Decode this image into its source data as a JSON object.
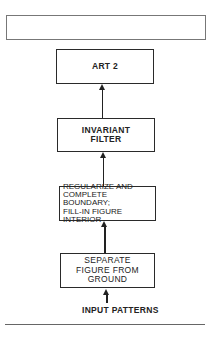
{
  "diagram": {
    "type": "flowchart",
    "direction": "bottom-to-top",
    "top_box": {
      "label": ""
    },
    "nodes": [
      {
        "id": "art2",
        "lines": [
          "ART 2"
        ]
      },
      {
        "id": "invariant_filter",
        "lines": [
          "INVARIANT",
          "FILTER"
        ]
      },
      {
        "id": "regularize",
        "lines": [
          "REGULARIZE AND",
          "COMPLETE BOUNDARY;",
          "FILL-IN FIGURE",
          "INTERIOR"
        ]
      },
      {
        "id": "separate",
        "lines": [
          "SEPARATE",
          "FIGURE FROM",
          "GROUND"
        ]
      }
    ],
    "input_label": "INPUT PATTERNS",
    "edges": [
      {
        "from": "input",
        "to": "separate"
      },
      {
        "from": "separate",
        "to": "regularize"
      },
      {
        "from": "regularize",
        "to": "invariant_filter"
      },
      {
        "from": "invariant_filter",
        "to": "art2"
      }
    ]
  }
}
